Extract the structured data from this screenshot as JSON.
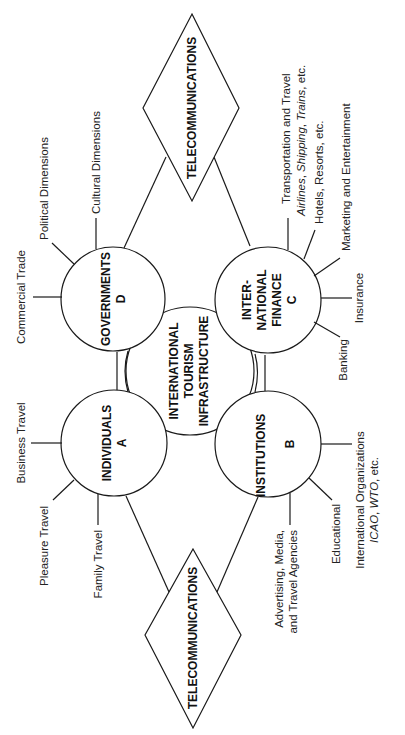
{
  "diagram": {
    "center": {
      "lines": [
        "INTERNATIONAL",
        "TOURISM",
        "INFRASTRUCTURE"
      ]
    },
    "nodes": {
      "individuals": {
        "lines": [
          "INDIVIDUALS",
          "A"
        ]
      },
      "governments": {
        "lines": [
          "GOVERNMENTS",
          "D"
        ]
      },
      "finance": {
        "lines": [
          "INTER-",
          "NATIONAL",
          "FINANCE",
          "C"
        ]
      },
      "institutions": {
        "lines": [
          "INSTITUTIONS",
          "B"
        ]
      }
    },
    "diamonds": {
      "top": "TELECOMMUNICATIONS",
      "bottom": "TELECOMMUNICATIONS"
    },
    "spokes": {
      "governments": [
        "Commercial Trade",
        "Political Dimensions",
        "Cultural Dimensions"
      ],
      "individuals": [
        "Business Travel",
        "Pleasure Travel",
        "Family Travel"
      ],
      "finance": {
        "transport_line1": "Transportation and Travel",
        "transport_line2": "Airlines, Shipping, Trains, etc.",
        "transport_italic_parts": [
          "Airlines",
          "Shipping",
          "Trains"
        ],
        "hotels": "Hotels, Resorts, etc.",
        "marketing": "Marketing and Entertainment",
        "insurance": "Insurance",
        "banking": "Banking"
      },
      "institutions": {
        "advertising_line1": "Advertising, Media,",
        "advertising_line2": "and Travel Agencies",
        "educational": "Educational",
        "intl_line1": "International Organizations",
        "intl_line2_italic1": "ICAO",
        "intl_line2_sep": ", ",
        "intl_line2_italic2": "WTO",
        "intl_line2_rest": ", etc."
      }
    }
  }
}
